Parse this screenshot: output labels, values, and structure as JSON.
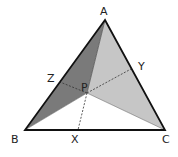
{
  "diagram": {
    "type": "triangle-cevians",
    "vertices": {
      "A": {
        "label": "A",
        "x": 105,
        "y": 20
      },
      "B": {
        "label": "B",
        "x": 25,
        "y": 130
      },
      "C": {
        "label": "C",
        "x": 165,
        "y": 130
      }
    },
    "interior_point": {
      "label": "P",
      "x": 87,
      "y": 93
    },
    "cevian_feet": {
      "X": {
        "label": "X",
        "x": 78,
        "y": 130
      },
      "Y": {
        "label": "Y",
        "x": 131,
        "y": 69
      },
      "Z": {
        "label": "Z",
        "x": 60,
        "y": 82
      }
    },
    "regions": [
      {
        "name": "triangle-ABP",
        "fill": "#7a7a7a"
      },
      {
        "name": "triangle-APC",
        "fill": "#c6c6c6"
      },
      {
        "name": "triangle-BPC",
        "fill": "#ffffff"
      }
    ],
    "colors": {
      "outline": "#111111",
      "dashed": "#333333"
    }
  }
}
